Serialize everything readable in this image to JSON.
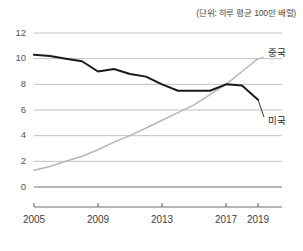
{
  "unit_note": "(단위: 하루 평균 100만 배럴)",
  "labels": {
    "china": "중국",
    "usa": "미국"
  },
  "colors": {
    "china_line": "#b6b6b6",
    "usa_line": "#1a1a1a",
    "gridline": "#b9b9b9",
    "axis": "#6f6f6f",
    "text": "#333333"
  },
  "chart_data": {
    "type": "line",
    "title": "",
    "subtitle": "",
    "xlabel": "",
    "ylabel": "",
    "annotation": "(단위: 하루 평균 100만 배럴)",
    "grid": true,
    "legend_position": "inline-right",
    "xlim": [
      2005,
      2019
    ],
    "ylim": [
      0,
      12
    ],
    "yticks": [
      0,
      2,
      4,
      6,
      8,
      10,
      12
    ],
    "ytick_labels": [
      "0",
      "2",
      "4",
      "6",
      "8",
      "10",
      "12"
    ],
    "xticks": [
      2005,
      2009,
      2013,
      2017,
      2019
    ],
    "xtick_labels": [
      "2005",
      "2009",
      "2013",
      "2017",
      "2019"
    ],
    "x": [
      2005,
      2006,
      2007,
      2008,
      2009,
      2010,
      2011,
      2012,
      2013,
      2014,
      2015,
      2016,
      2017,
      2018,
      2019
    ],
    "series": [
      {
        "name": "미국",
        "color": "#1a1a1a",
        "values": [
          10.3,
          10.2,
          10.0,
          9.8,
          9.0,
          9.2,
          8.8,
          8.6,
          8.0,
          7.5,
          7.5,
          7.5,
          8.0,
          7.9,
          6.8
        ]
      },
      {
        "name": "중국",
        "color": "#b6b6b6",
        "values": [
          1.3,
          1.6,
          2.0,
          2.4,
          2.9,
          3.5,
          4.0,
          4.6,
          5.2,
          5.8,
          6.4,
          7.2,
          8.0,
          9.0,
          10.0
        ]
      }
    ]
  }
}
